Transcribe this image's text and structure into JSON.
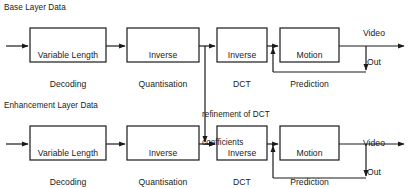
{
  "diagram": {
    "stroke_color": "#1a1a1a",
    "text_color": "#1a1a1a",
    "background": "#ffffff",
    "labels": {
      "base_layer": "Base Layer Data",
      "enhancement_layer": "Enhancement Layer Data",
      "refinement_note_line1": "refinement of DCT",
      "refinement_note_line2": "coefficients",
      "video_out_top_line1": "Video",
      "video_out_top_line2": "Out",
      "video_out_bottom_line1": "Video",
      "video_out_bottom_line2": "Out"
    },
    "base_row": {
      "blocks": [
        {
          "id": "vld",
          "line1": "Variable Length",
          "line2": "Decoding"
        },
        {
          "id": "iq",
          "line1": "Inverse",
          "line2": "Quantisation"
        },
        {
          "id": "idct",
          "line1": "Inverse",
          "line2": "DCT"
        },
        {
          "id": "mp",
          "line1": "Motion",
          "line2": "Prediction"
        }
      ]
    },
    "enhancement_row": {
      "blocks": [
        {
          "id": "vld",
          "line1": "Variable Length",
          "line2": "Decoding"
        },
        {
          "id": "iq",
          "line1": "Inverse",
          "line2": "Quantisation"
        },
        {
          "id": "idct",
          "line1": "Inverse",
          "line2": "DCT"
        },
        {
          "id": "mp",
          "line1": "Motion",
          "line2": "Prediction"
        }
      ]
    }
  }
}
